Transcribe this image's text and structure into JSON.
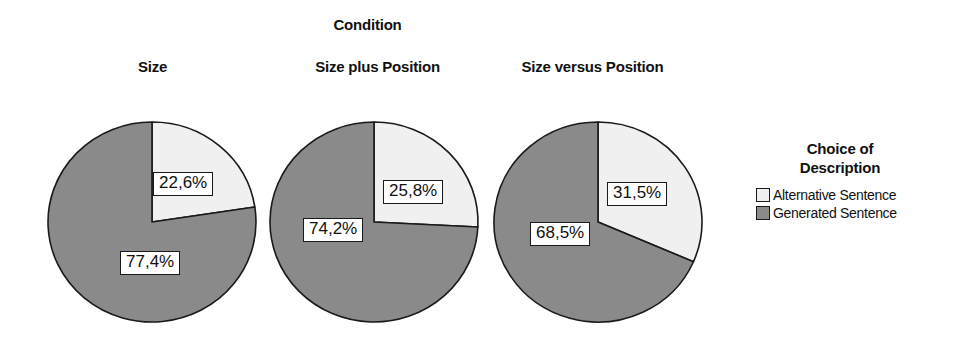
{
  "chart_data": {
    "type": "pie",
    "title": "Condition",
    "xlabel": "",
    "ylabel": "",
    "legend_position": "right",
    "grid": false,
    "legend_title_line1": "Choice of",
    "legend_title_line2": "Description",
    "series": [
      {
        "name": "Alternative Sentence",
        "color": "#f0f0f0",
        "values": [
          22.6,
          25.8,
          31.5
        ]
      },
      {
        "name": "Generated Sentence",
        "color": "#8a8a8a",
        "values": [
          77.4,
          74.2,
          68.5
        ]
      }
    ],
    "categories": [
      "Size",
      "Size plus Position",
      "Size versus Position"
    ],
    "pies": [
      {
        "condition": "Size",
        "slices": [
          {
            "label": "Alternative Sentence",
            "value": 22.6,
            "display": "22,6%",
            "color": "#f0f0f0"
          },
          {
            "label": "Generated Sentence",
            "value": 77.4,
            "display": "77,4%",
            "color": "#8a8a8a"
          }
        ]
      },
      {
        "condition": "Size plus Position",
        "slices": [
          {
            "label": "Alternative Sentence",
            "value": 25.8,
            "display": "25,8%",
            "color": "#f0f0f0"
          },
          {
            "label": "Generated Sentence",
            "value": 74.2,
            "display": "74,2%",
            "color": "#8a8a8a"
          }
        ]
      },
      {
        "condition": "Size versus Position",
        "slices": [
          {
            "label": "Alternative Sentence",
            "value": 31.5,
            "display": "31,5%",
            "color": "#f0f0f0"
          },
          {
            "label": "Generated Sentence",
            "value": 68.5,
            "display": "68,5%",
            "color": "#8a8a8a"
          }
        ]
      }
    ]
  },
  "colors": {
    "alternative": "#f0f0f0",
    "generated": "#8a8a8a",
    "outline": "#1a1a1a",
    "text": "#111111",
    "background": "#ffffff"
  }
}
